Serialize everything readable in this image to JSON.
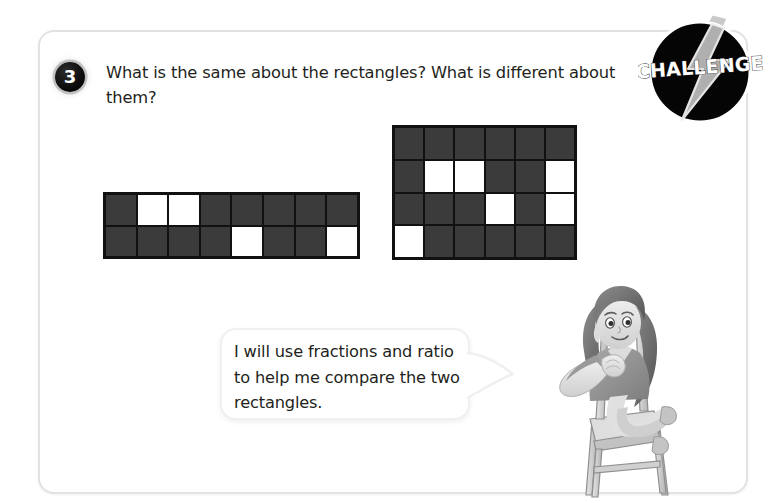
{
  "page": {
    "background_color": "#ffffff",
    "card_border_color": "#e2e2e2"
  },
  "question": {
    "number": "3",
    "text": "What is the same about the rectangles? What is different about them?"
  },
  "badge": {
    "label": "CHALLENGE",
    "icon": "lightning-bolt-icon",
    "circle_color": "#000000",
    "bolt_color": "#b9b9b9"
  },
  "speech_bubble": {
    "text": "I will use fractions and ratio to help me compare the two rectangles.",
    "speaker": "girl-sitting-on-chair"
  },
  "rectangles": [
    {
      "name": "rectangle-a",
      "columns": 8,
      "rows": 2,
      "total_cells": 16,
      "white_cells": 4,
      "shaded_cells": 12,
      "fraction_shaded": "12/16",
      "ratio_shaded_to_white": "12:4",
      "cells": [
        [
          "shaded",
          "white",
          "white",
          "shaded",
          "shaded",
          "shaded",
          "shaded",
          "shaded"
        ],
        [
          "shaded",
          "shaded",
          "shaded",
          "shaded",
          "white",
          "shaded",
          "shaded",
          "white"
        ]
      ]
    },
    {
      "name": "rectangle-b",
      "columns": 6,
      "rows": 4,
      "total_cells": 24,
      "white_cells": 6,
      "shaded_cells": 18,
      "fraction_shaded": "18/24",
      "ratio_shaded_to_white": "18:6",
      "cells": [
        [
          "shaded",
          "shaded",
          "shaded",
          "shaded",
          "shaded",
          "shaded"
        ],
        [
          "shaded",
          "white",
          "white",
          "shaded",
          "shaded",
          "white"
        ],
        [
          "shaded",
          "shaded",
          "shaded",
          "white",
          "shaded",
          "white"
        ],
        [
          "white",
          "shaded",
          "shaded",
          "shaded",
          "shaded",
          "shaded"
        ]
      ]
    }
  ],
  "colors": {
    "cell_shaded": "#3b3b3b",
    "cell_white": "#ffffff",
    "grid_line": "#111111",
    "text": "#231f20"
  }
}
